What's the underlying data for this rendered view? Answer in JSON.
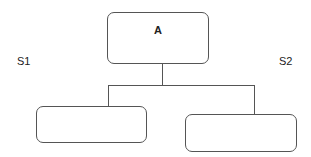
{
  "diagram": {
    "root": {
      "label": "A"
    },
    "children": [
      {
        "label": ""
      },
      {
        "label": ""
      }
    ],
    "side_labels": {
      "left": "S1",
      "right": "S2"
    },
    "colors": {
      "stroke": "#555555",
      "text": "#222222",
      "background": "#ffffff"
    }
  }
}
